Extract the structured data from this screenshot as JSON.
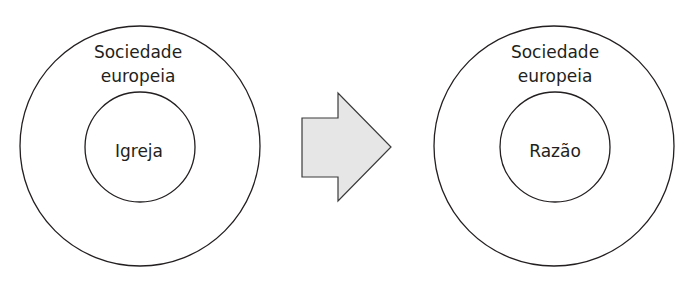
{
  "diagram": {
    "left": {
      "outer_label_line1": "Sociedade",
      "outer_label_line2": "europeia",
      "inner_label": "Igreja"
    },
    "arrow": {
      "direction": "right",
      "fill": "#e6e6e6",
      "stroke": "#3a3a3a"
    },
    "right": {
      "outer_label_line1": "Sociedade",
      "outer_label_line2": "europeia",
      "inner_label": "Razão"
    },
    "colors": {
      "line": "#231f20",
      "background": "#ffffff"
    }
  }
}
